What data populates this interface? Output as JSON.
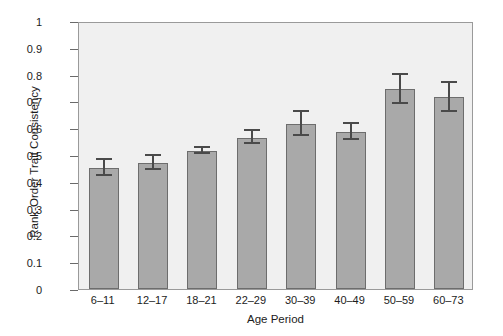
{
  "chart_data": {
    "type": "bar",
    "title": "",
    "xlabel": "Age Period",
    "ylabel": "Rank-Order Trait Consistency",
    "categories": [
      "6–11",
      "12–17",
      "18–21",
      "22–29",
      "30–39",
      "40–49",
      "50–59",
      "60–73"
    ],
    "values": [
      0.45,
      0.47,
      0.515,
      0.565,
      0.615,
      0.585,
      0.745,
      0.715
    ],
    "errors": [
      0.03,
      0.025,
      0.01,
      0.025,
      0.045,
      0.03,
      0.055,
      0.055
    ],
    "ylim": [
      0,
      1
    ],
    "yticks": [
      "0",
      "0.1",
      "0.2",
      "0.3",
      "0.4",
      "0.5",
      "0.6",
      "0.7",
      "0.8",
      "0.9",
      "1"
    ],
    "ytick_values": [
      0,
      0.1,
      0.2,
      0.3,
      0.4,
      0.5,
      0.6,
      0.7,
      0.8,
      0.9,
      1
    ],
    "grid": false,
    "legend": null,
    "legend_position": "none",
    "error_bar_style": "symmetric-capped",
    "colors": {
      "bar_fill": "#a9a9a9",
      "bar_edge": "#6d6d6d",
      "error_bar": "#4a4a4a",
      "plot_background": "#f0f0f0",
      "figure_background": "#ffffff",
      "axis_line": "#9a9a9a",
      "text": "#1c1c1c"
    }
  }
}
